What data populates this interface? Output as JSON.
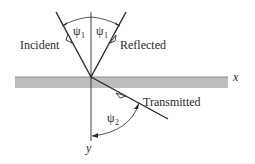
{
  "diagram": {
    "type": "ray-reflection-refraction",
    "labels": {
      "incident": "Incident",
      "reflected": "Reflected",
      "transmitted": "Transmitted",
      "x_axis": "x",
      "y_axis": "y",
      "psi1_left": "ψ",
      "psi1_right": "ψ",
      "psi2": "ψ",
      "sub1": "1",
      "sub2": "2"
    },
    "colors": {
      "line": "#2a2a2a",
      "interface_band": "#b8b8b8",
      "interface_edge": "#8a8a8a",
      "background": "#ffffff"
    }
  }
}
